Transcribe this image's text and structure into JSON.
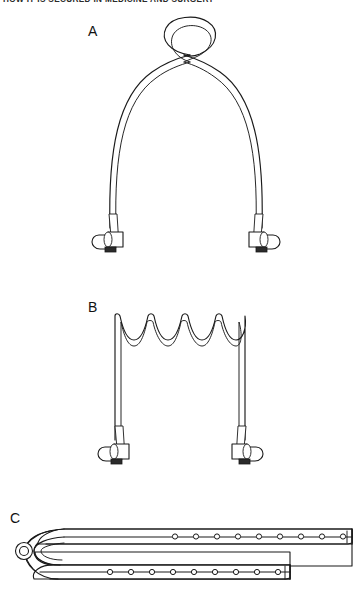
{
  "page": {
    "width": 363,
    "height": 590,
    "background": "#ffffff",
    "ink": "#1a1a1a"
  },
  "header": {
    "text": "HOW IT IS SECURED IN MEDICINE AND SURGERY",
    "clipped": "true"
  },
  "figure": {
    "caption_labels": [
      "A",
      "B",
      "C"
    ],
    "panels": [
      {
        "id": "A",
        "label": "A",
        "label_x": 92,
        "label_y": 30,
        "device": "looped-tube-retractor",
        "description": "Flexible double-walled tube bent into an inverted U arch with the two legs crossing near the top to form a closed circular loop; each leg terminates in a clamp fitting.",
        "loop": {
          "cx": 187,
          "cy": 43,
          "r_outer": 25,
          "r_inner": 20
        },
        "arch": {
          "left_leg_x": 110,
          "right_leg_x": 262,
          "apex_y": 64,
          "foot_y": 228
        },
        "end_fittings": 2
      },
      {
        "id": "B",
        "label": "B",
        "label_x": 92,
        "label_y": 306,
        "device": "wave-top-frame-retractor",
        "description": "Rectangular double-walled frame whose top bar is formed into a continuous sine wave with four rounded troughs and five crests; the two vertical legs terminate in clamp fittings.",
        "waves": {
          "troughs": 4,
          "crests": 5,
          "top_y": 313,
          "amplitude": 17,
          "left_x": 115,
          "right_x": 245
        },
        "legs": {
          "left_x": 115,
          "right_x": 245,
          "foot_y": 440
        },
        "end_fittings": 2
      },
      {
        "id": "C",
        "label": "C",
        "label_x": 14,
        "label_y": 517,
        "device": "perforated-folded-strap",
        "description": "A long flat perforated strap folded back on itself around a small round ring at the left end, forming an upper band and a lower band, each pierced with a row of round holes.",
        "ring": {
          "cx": 24,
          "cy": 550,
          "r_outer": 8,
          "r_inner": 4.5
        },
        "upper_band": {
          "y_top": 529,
          "y_bottom": 543,
          "x_left": 40,
          "x_right": 352,
          "holes": 9
        },
        "lower_band": {
          "y_top": 565,
          "y_bottom": 579,
          "x_left": 30,
          "x_right": 290,
          "holes": 9
        },
        "total_holes": 18
      }
    ],
    "clamp": {
      "name": "tube-end-clamp",
      "parts": [
        "wing-lever",
        "barrel",
        "collar-tab"
      ],
      "count_per_panel": 2
    }
  }
}
